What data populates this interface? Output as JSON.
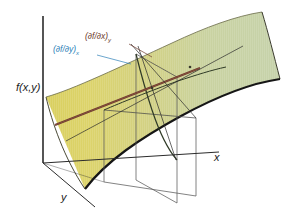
{
  "figure": {
    "type": "3d-surface-diagram",
    "background_color": "#ffffff"
  },
  "axes": {
    "vertical": {
      "label": "f(x,y)",
      "name": "f-axis"
    },
    "horizontal_right": {
      "label": "x",
      "name": "x-axis"
    },
    "depth_left": {
      "label": "y",
      "name": "y-axis"
    },
    "axis_color": "#2b2b2b"
  },
  "annotations": [
    {
      "id": "dfdx",
      "text": "(∂f/∂x)",
      "subscript": "y",
      "color": "#6e3b2e",
      "leader_to": "tangent-line-x"
    },
    {
      "id": "dfdy",
      "text": "(∂f/∂y)",
      "subscript": "x",
      "color": "#2c7fb8",
      "leader_to": "tangent-line-y"
    }
  ],
  "surface": {
    "name": "f-surface",
    "fill_left": "#d8cf63",
    "fill_mid": "#cfd08a",
    "fill_right": "#c9d4ab",
    "edge_color": "#1a1a1a",
    "description": "saddle-shaped surface rising to the right"
  },
  "cutting_planes": {
    "plane_x": {
      "name": "plane-constant-y",
      "edge_color": "#555555"
    },
    "plane_y": {
      "name": "plane-constant-x",
      "edge_color": "#555555"
    }
  },
  "curves": {
    "tangent_line": {
      "name": "tangent-line",
      "color": "#6e3b2e"
    },
    "section_curve_x": {
      "name": "section-curve-constant-y",
      "color": "#2e3a24"
    },
    "section_curve_y": {
      "name": "section-curve-constant-x",
      "color": "#2e3a24"
    }
  }
}
